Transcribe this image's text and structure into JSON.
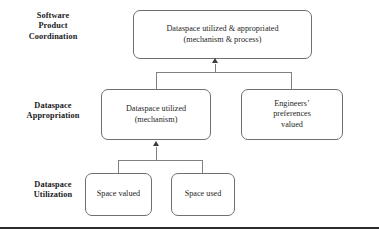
{
  "figure": {
    "type": "hierarchical-tier-diagram",
    "width": 379,
    "height": 236,
    "background_color": "#ffffff",
    "box_border_color": "#6f6f6f",
    "connector_color": "#808080",
    "arrowhead_color": "#3a3a3a",
    "rule_color": "#2b2b2b"
  },
  "tiers": [
    {
      "id": "software-product-coordination",
      "label": "Software\nProduct\nCoordination"
    },
    {
      "id": "dataspace-appropriation",
      "label": "Dataspace\nAppropriation"
    },
    {
      "id": "dataspace-utilization",
      "label": "Dataspace\nUtilization"
    }
  ],
  "nodes": [
    {
      "id": "dataspace-utilized-appropriated",
      "tier": "software-product-coordination",
      "label": "Dataspace utilized & appropriated\n(mechanism & process)"
    },
    {
      "id": "dataspace-utilized-mechanism",
      "tier": "dataspace-appropriation",
      "label": "Dataspace utilized\n(mechanism)"
    },
    {
      "id": "engineers-preferences-valued",
      "tier": "dataspace-appropriation",
      "label": "Engineers’\npreferences\nvalued"
    },
    {
      "id": "space-valued",
      "tier": "dataspace-utilization",
      "label": "Space valued"
    },
    {
      "id": "space-used",
      "tier": "dataspace-utilization",
      "label": "Space used"
    }
  ],
  "connections": [
    {
      "id": "appropriation-to-coordination",
      "from": [
        "dataspace-utilized-mechanism",
        "engineers-preferences-valued"
      ],
      "to": "dataspace-utilized-appropriated",
      "style": "bracket-merge",
      "arrow": "up"
    },
    {
      "id": "utilization-to-appropriation",
      "from": [
        "space-valued",
        "space-used"
      ],
      "to": "dataspace-utilized-mechanism",
      "style": "bracket-merge",
      "arrow": "up"
    }
  ]
}
